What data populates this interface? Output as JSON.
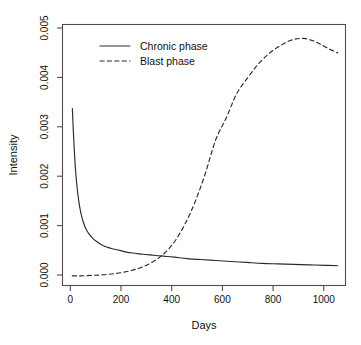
{
  "chart_data": {
    "type": "line",
    "title": "",
    "xlabel": "Days",
    "ylabel": "Intensity",
    "xlim": [
      -30,
      1060
    ],
    "ylim": [
      -0.00018,
      0.00525
    ],
    "grid": false,
    "legend_position": "top-left-inside",
    "xticks": [
      0,
      200,
      400,
      600,
      800,
      1000
    ],
    "xtick_labels": [
      "0",
      "200",
      "400",
      "600",
      "800",
      "1000"
    ],
    "yticks": [
      0.0,
      0.001,
      0.002,
      0.003,
      0.004,
      0.005
    ],
    "ytick_labels": [
      "0.000",
      "0.001",
      "0.002",
      "0.003",
      "0.004",
      "0.005"
    ],
    "series": [
      {
        "name": "Chronic phase",
        "style": "solid",
        "color": "#2b2b2b",
        "x": [
          8,
          12,
          16,
          20,
          25,
          30,
          36,
          42,
          50,
          60,
          70,
          85,
          100,
          120,
          140,
          165,
          190,
          220,
          250,
          280,
          320,
          360,
          400,
          450,
          500,
          560,
          620,
          680,
          740,
          800,
          860,
          920,
          980,
          1030
        ],
        "y": [
          0.0035,
          0.003,
          0.00258,
          0.00224,
          0.00192,
          0.00168,
          0.00146,
          0.0013,
          0.00114,
          0.001,
          0.00091,
          0.00081,
          0.00074,
          0.00067,
          0.00062,
          0.00058,
          0.00055,
          0.00051,
          0.00049,
          0.00047,
          0.00045,
          0.00043,
          0.00041,
          0.00038,
          0.00036,
          0.00034,
          0.00032,
          0.0003,
          0.00028,
          0.00027,
          0.00026,
          0.00025,
          0.00024,
          0.00023
        ]
      },
      {
        "name": "Blast phase",
        "style": "dashed",
        "color": "#2b2b2b",
        "x": [
          8,
          40,
          80,
          120,
          160,
          200,
          240,
          280,
          320,
          360,
          400,
          440,
          480,
          520,
          560,
          600,
          640,
          680,
          720,
          760,
          800,
          840,
          870,
          900,
          930,
          960,
          990,
          1030
        ],
        "y": [
          2e-05,
          2e-05,
          3e-05,
          4e-05,
          6e-05,
          9e-05,
          0.00014,
          0.00021,
          0.00032,
          0.00048,
          0.00072,
          0.00108,
          0.00155,
          0.00215,
          0.00285,
          0.0033,
          0.0038,
          0.00412,
          0.0044,
          0.00462,
          0.00478,
          0.0049,
          0.00495,
          0.00496,
          0.00492,
          0.00485,
          0.00476,
          0.00466
        ]
      }
    ],
    "annotations": {
      "crossover_day": 360,
      "crossover_intensity": 0.00045,
      "chronic_peak": 0.0035,
      "blast_peak": 0.00496,
      "blast_peak_day": 890
    }
  },
  "legend": {
    "entries": [
      {
        "label": "Chronic phase",
        "style": "solid"
      },
      {
        "label": "Blast phase",
        "style": "dashed"
      }
    ]
  }
}
